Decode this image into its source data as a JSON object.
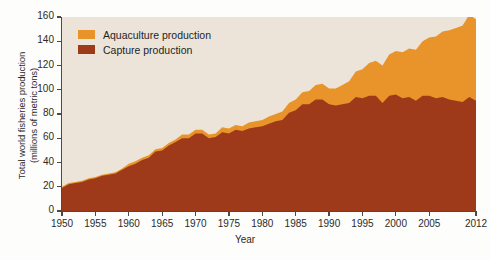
{
  "chart_data": {
    "type": "area",
    "title": "",
    "xlabel": "Year",
    "ylabel": "Total world fisheries production\n(millions of metric tons)",
    "xlim": [
      1950,
      2012
    ],
    "ylim": [
      0,
      160
    ],
    "ytick_step": 20,
    "grid": false,
    "stacked": true,
    "legend_position": "top-left",
    "background_color": "#ece4d8",
    "xticks": [
      "1950",
      "1955",
      "1960",
      "1965",
      "1970",
      "1975",
      "1980",
      "1985",
      "1990",
      "1995",
      "2000",
      "2005",
      "2012"
    ],
    "xtick_values": [
      1950,
      1955,
      1960,
      1965,
      1970,
      1975,
      1980,
      1985,
      1990,
      1995,
      2000,
      2005,
      2012
    ],
    "yticks": [
      "0",
      "20",
      "40",
      "60",
      "80",
      "100",
      "120",
      "140",
      "160"
    ],
    "ytick_values": [
      0,
      20,
      40,
      60,
      80,
      100,
      120,
      140,
      160
    ],
    "x": [
      1950,
      1951,
      1952,
      1953,
      1954,
      1955,
      1956,
      1957,
      1958,
      1959,
      1960,
      1961,
      1962,
      1963,
      1964,
      1965,
      1966,
      1967,
      1968,
      1969,
      1970,
      1971,
      1972,
      1973,
      1974,
      1975,
      1976,
      1977,
      1978,
      1979,
      1980,
      1981,
      1982,
      1983,
      1984,
      1985,
      1986,
      1987,
      1988,
      1989,
      1990,
      1991,
      1992,
      1993,
      1994,
      1995,
      1996,
      1997,
      1998,
      1999,
      2000,
      2001,
      2002,
      2003,
      2004,
      2005,
      2006,
      2007,
      2008,
      2009,
      2010,
      2011,
      2012
    ],
    "series": [
      {
        "name": "Capture production",
        "color": "#9e3a1a",
        "values": [
          19,
          22,
          23,
          24,
          26,
          27,
          29,
          30,
          31,
          34,
          37,
          39,
          42,
          44,
          49,
          50,
          54,
          57,
          60,
          60,
          64,
          64,
          60,
          61,
          65,
          64,
          67,
          66,
          68,
          69,
          70,
          72,
          74,
          75,
          81,
          83,
          88,
          88,
          92,
          92,
          88,
          87,
          88,
          89,
          94,
          93,
          95,
          95,
          89,
          95,
          96,
          93,
          94,
          91,
          95,
          95,
          93,
          94,
          92,
          91,
          90,
          94,
          91
        ]
      },
      {
        "name": "Aquaculture production",
        "color": "#e8942a",
        "values": [
          1,
          1,
          1,
          1,
          1,
          1,
          1,
          1,
          1,
          1,
          2,
          2,
          2,
          2,
          2,
          2,
          2,
          2,
          3,
          3,
          3,
          3,
          3,
          3,
          4,
          4,
          4,
          4,
          5,
          5,
          5,
          6,
          6,
          7,
          8,
          9,
          10,
          11,
          12,
          13,
          13,
          14,
          16,
          18,
          21,
          24,
          27,
          29,
          31,
          34,
          36,
          38,
          40,
          42,
          45,
          48,
          51,
          54,
          57,
          60,
          63,
          68,
          67
        ]
      }
    ],
    "totals": [
      20,
      23,
      24,
      25,
      27,
      28,
      30,
      31,
      32,
      35,
      39,
      41,
      44,
      46,
      51,
      52,
      56,
      59,
      63,
      63,
      67,
      67,
      63,
      64,
      69,
      68,
      71,
      70,
      73,
      74,
      75,
      78,
      80,
      82,
      89,
      92,
      98,
      99,
      104,
      105,
      101,
      101,
      104,
      107,
      115,
      117,
      122,
      124,
      120,
      129,
      132,
      131,
      134,
      133,
      140,
      143,
      144,
      148,
      149,
      151,
      153,
      162,
      158
    ]
  },
  "legend": {
    "items": [
      {
        "label": "Aquaculture production",
        "color": "#e8942a"
      },
      {
        "label": "Capture production",
        "color": "#9e3a1a"
      }
    ]
  }
}
